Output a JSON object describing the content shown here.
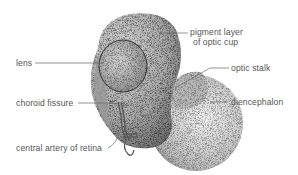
{
  "diagram": {
    "labels": {
      "lens": "lens",
      "pigment_layer_line1": "pigment layer",
      "pigment_layer_line2": "of optic cup",
      "optic_stalk": "optic stalk",
      "choroid_fissure": "choroid fissure",
      "diencephalon": "diencephalon",
      "central_artery": "central artery of retina"
    },
    "colors": {
      "label_text": "#555555",
      "leader_line": "#666666",
      "stipple_dark": "#333333",
      "background": "#ffffff"
    }
  }
}
